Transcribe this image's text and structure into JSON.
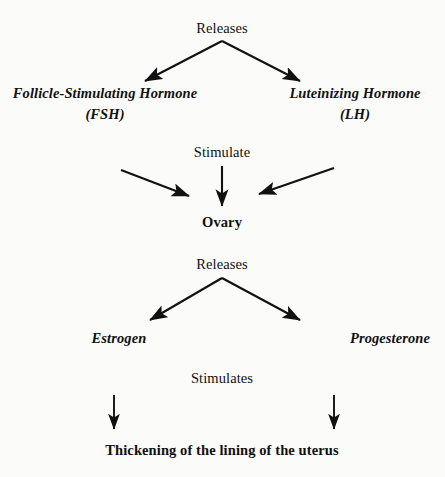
{
  "diagram": {
    "background_color": "#fbfbfa",
    "ink_color": "#111111",
    "nodes": {
      "releases_1": "Releases",
      "fsh_name": "Follicle-Stimulating Hormone",
      "fsh_abbr": "(FSH)",
      "lh_name": "Luteinizing Hormone",
      "lh_abbr": "(LH)",
      "stimulate": "Stimulate",
      "ovary": "Ovary",
      "releases_2": "Releases",
      "estrogen": "Estrogen",
      "progesterone": "Progesterone",
      "stimulates": "Stimulates",
      "thickening": "Thickening of the lining of the uterus"
    },
    "edges": [
      {
        "name": "releases-to-fsh",
        "from": "Releases",
        "to": "Follicle-Stimulating Hormone (FSH)"
      },
      {
        "name": "releases-to-lh",
        "from": "Releases",
        "to": "Luteinizing Hormone (LH)"
      },
      {
        "name": "fsh-to-ovary",
        "from": "Follicle-Stimulating Hormone (FSH)",
        "to": "Ovary",
        "label": "Stimulate"
      },
      {
        "name": "stimulate-to-ovary",
        "from": "Stimulate",
        "to": "Ovary"
      },
      {
        "name": "lh-to-ovary",
        "from": "Luteinizing Hormone (LH)",
        "to": "Ovary",
        "label": "Stimulate"
      },
      {
        "name": "ovary-to-estrogen",
        "from": "Ovary",
        "to": "Estrogen",
        "label": "Releases"
      },
      {
        "name": "ovary-to-progesterone",
        "from": "Ovary",
        "to": "Progesterone",
        "label": "Releases"
      },
      {
        "name": "estrogen-to-thickening",
        "from": "Estrogen",
        "to": "Thickening of the lining of the uterus",
        "label": "Stimulates"
      },
      {
        "name": "progesterone-to-thickening",
        "from": "Progesterone",
        "to": "Thickening of the lining of the uterus",
        "label": "Stimulates"
      }
    ]
  }
}
